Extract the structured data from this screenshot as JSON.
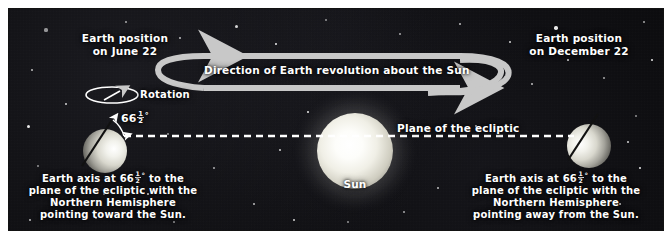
{
  "figure": {
    "background_color": "#ffffff",
    "panel_color": "#0a0a0c",
    "arrow_color": "#c8c8c8",
    "text_color": "#ffffff"
  },
  "labels": {
    "left_position_line1": "Earth position",
    "left_position_line2": "on June 22",
    "right_position_line1": "Earth position",
    "right_position_line2": "on December 22",
    "rotation": "Rotation",
    "revolution": "Direction of Earth revolution about the Sun",
    "ecliptic": "Plane of the ecliptic",
    "sun": "Sun",
    "angle_whole": "66",
    "angle_num": "1",
    "angle_den": "2",
    "angle_degree": "°"
  },
  "left_caption": {
    "line1_pre": "Earth axis at ",
    "line1_post": " to the",
    "line2": "plane of the ecliptic with the",
    "line3": "Northern Hemisphere",
    "line4": "pointing toward the Sun."
  },
  "right_caption": {
    "line1_pre": "Earth axis at ",
    "line1_post": " to the",
    "line2": "plane of the ecliptic with the",
    "line3": "Northern Hemisphere",
    "line4": "pointing away from the Sun."
  },
  "bodies": {
    "sun_name": "Sun",
    "sun_cx": 347,
    "sun_cy": 143,
    "sun_r": 38,
    "earth_june_name": "earth-june-22",
    "earth_june_cx": 97,
    "earth_june_cy": 143,
    "earth_june_r": 22,
    "earth_december_name": "earth-december-22",
    "earth_december_cx": 581,
    "earth_december_cy": 138,
    "earth_december_r": 22,
    "axis_tilt_degrees": 66.5
  },
  "stars": [
    {
      "x": 38,
      "y": 22,
      "r": 1.6
    },
    {
      "x": 118,
      "y": 14,
      "r": 1.2
    },
    {
      "x": 172,
      "y": 30,
      "r": 1.0
    },
    {
      "x": 228,
      "y": 18,
      "r": 1.5
    },
    {
      "x": 268,
      "y": 36,
      "r": 0.9
    },
    {
      "x": 318,
      "y": 12,
      "r": 1.3
    },
    {
      "x": 392,
      "y": 26,
      "r": 1.0
    },
    {
      "x": 452,
      "y": 16,
      "r": 1.4
    },
    {
      "x": 502,
      "y": 34,
      "r": 1.1
    },
    {
      "x": 548,
      "y": 20,
      "r": 1.7
    },
    {
      "x": 600,
      "y": 30,
      "r": 1.0
    },
    {
      "x": 636,
      "y": 14,
      "r": 1.3
    },
    {
      "x": 24,
      "y": 62,
      "r": 1.1
    },
    {
      "x": 58,
      "y": 96,
      "r": 1.4
    },
    {
      "x": 20,
      "y": 118,
      "r": 1.5
    },
    {
      "x": 30,
      "y": 158,
      "r": 1.0
    },
    {
      "x": 46,
      "y": 196,
      "r": 1.3
    },
    {
      "x": 22,
      "y": 212,
      "r": 1.2
    },
    {
      "x": 88,
      "y": 210,
      "r": 1.0
    },
    {
      "x": 140,
      "y": 186,
      "r": 1.1
    },
    {
      "x": 166,
      "y": 214,
      "r": 1.3
    },
    {
      "x": 206,
      "y": 160,
      "r": 0.9
    },
    {
      "x": 246,
      "y": 196,
      "r": 1.2
    },
    {
      "x": 286,
      "y": 212,
      "r": 1.0
    },
    {
      "x": 300,
      "y": 104,
      "r": 1.0
    },
    {
      "x": 340,
      "y": 214,
      "r": 1.4
    },
    {
      "x": 396,
      "y": 204,
      "r": 1.1
    },
    {
      "x": 430,
      "y": 180,
      "r": 1.0
    },
    {
      "x": 466,
      "y": 208,
      "r": 1.2
    },
    {
      "x": 468,
      "y": 118,
      "r": 1.0
    },
    {
      "x": 506,
      "y": 168,
      "r": 1.3
    },
    {
      "x": 512,
      "y": 196,
      "r": 0.9
    },
    {
      "x": 560,
      "y": 206,
      "r": 1.1
    },
    {
      "x": 612,
      "y": 196,
      "r": 1.2
    },
    {
      "x": 632,
      "y": 160,
      "r": 1.4
    },
    {
      "x": 628,
      "y": 108,
      "r": 1.0
    },
    {
      "x": 596,
      "y": 70,
      "r": 1.2
    },
    {
      "x": 524,
      "y": 76,
      "r": 1.0
    },
    {
      "x": 560,
      "y": 52,
      "r": 1.1
    },
    {
      "x": 644,
      "y": 52,
      "r": 1.0
    },
    {
      "x": 160,
      "y": 126,
      "r": 0.9
    },
    {
      "x": 96,
      "y": 186,
      "r": 0.9
    },
    {
      "x": 272,
      "y": 142,
      "r": 0.8
    },
    {
      "x": 620,
      "y": 134,
      "r": 1.0
    }
  ]
}
